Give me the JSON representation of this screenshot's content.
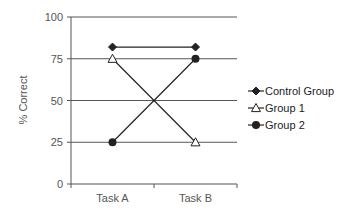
{
  "chart_data": {
    "type": "line",
    "title": "",
    "xlabel": "",
    "ylabel": "% Correct",
    "categories": [
      "Task A",
      "Task B"
    ],
    "ylim": [
      0,
      100
    ],
    "yticks": [
      0,
      25,
      50,
      75,
      100
    ],
    "grid": true,
    "legend_position": "right",
    "series": [
      {
        "name": "Control Group",
        "values": [
          82,
          82
        ],
        "marker": "diamond-filled"
      },
      {
        "name": "Group 1",
        "values": [
          75,
          25
        ],
        "marker": "triangle-open"
      },
      {
        "name": "Group 2",
        "values": [
          25,
          75
        ],
        "marker": "circle-filled"
      }
    ],
    "colors": {
      "line": "#222222",
      "grid": "#555555",
      "text": "#555555"
    }
  }
}
